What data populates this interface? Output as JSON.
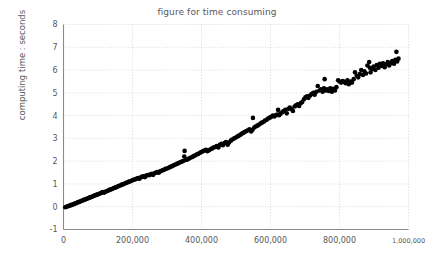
{
  "chart_data": {
    "type": "scatter",
    "title": "figure for time consuming",
    "xlabel": "",
    "ylabel": "computing time : seconds",
    "xlim": [
      0,
      1000000
    ],
    "ylim": [
      -1,
      8
    ],
    "grid": true,
    "legend": null,
    "marker": {
      "shape": "circle",
      "color": "#000000",
      "size": 4.6
    },
    "xticks": [
      0,
      200000,
      400000,
      600000,
      800000,
      1000000
    ],
    "xtick_labels": [
      "0",
      "200,000",
      "400,000",
      "600,000",
      "800,000",
      "1,000,000"
    ],
    "yticks": [
      -1,
      0,
      1,
      2,
      3,
      4,
      5,
      6,
      7,
      8
    ],
    "ytick_labels": [
      "-1",
      "0",
      "1",
      "2",
      "3",
      "4",
      "5",
      "6",
      "7",
      "8"
    ],
    "series": [
      {
        "name": "computing time",
        "x": [
          5000,
          9000,
          12000,
          15000,
          18000,
          21000,
          24000,
          27000,
          30000,
          33000,
          36000,
          39000,
          42000,
          45000,
          48000,
          51000,
          55000,
          58000,
          61000,
          64000,
          67000,
          70000,
          74000,
          77000,
          80000,
          84000,
          87000,
          90000,
          94000,
          97000,
          100000,
          104000,
          107000,
          111000,
          114000,
          118000,
          121000,
          125000,
          128000,
          132000,
          135000,
          139000,
          142000,
          146000,
          150000,
          153000,
          157000,
          160000,
          164000,
          168000,
          171000,
          175000,
          179000,
          182000,
          186000,
          190000,
          194000,
          197000,
          201000,
          205000,
          209000,
          213000,
          216000,
          220000,
          224000,
          228000,
          232000,
          236000,
          240000,
          244000,
          248000,
          252000,
          256000,
          260000,
          264000,
          268000,
          272000,
          276000,
          280000,
          284000,
          288000,
          292000,
          296000,
          300000,
          305000,
          309000,
          313000,
          317000,
          321000,
          326000,
          330000,
          334000,
          338000,
          343000,
          347000,
          350000,
          351000,
          355000,
          360000,
          364000,
          368000,
          373000,
          377000,
          381000,
          386000,
          390000,
          395000,
          399000,
          404000,
          408000,
          413000,
          417000,
          422000,
          426000,
          431000,
          435000,
          440000,
          444000,
          449000,
          453000,
          458000,
          462000,
          467000,
          471000,
          476000,
          480000,
          485000,
          489000,
          494000,
          498000,
          503000,
          507000,
          512000,
          516000,
          521000,
          525000,
          530000,
          535000,
          539000,
          544000,
          548000,
          549000,
          553000,
          557000,
          562000,
          566000,
          571000,
          575000,
          580000,
          584000,
          589000,
          593000,
          598000,
          602000,
          607000,
          611000,
          616000,
          620000,
          622000,
          625000,
          629000,
          634000,
          638000,
          643000,
          647000,
          652000,
          656000,
          661000,
          665000,
          670000,
          674000,
          679000,
          683000,
          688000,
          692000,
          697000,
          701000,
          706000,
          710000,
          715000,
          719000,
          724000,
          728000,
          733000,
          737000,
          742000,
          746000,
          751000,
          755000,
          757000,
          760000,
          764000,
          769000,
          773000,
          778000,
          782000,
          787000,
          791000,
          796000,
          800000,
          805000,
          809000,
          814000,
          818000,
          823000,
          827000,
          832000,
          836000,
          841000,
          845000,
          850000,
          854000,
          859000,
          863000,
          868000,
          872000,
          877000,
          881000,
          886000,
          888000,
          890000,
          895000,
          899000,
          904000,
          908000,
          913000,
          917000,
          922000,
          926000,
          931000,
          935000,
          940000,
          944000,
          949000,
          953000,
          958000,
          962000,
          965000,
          967000,
          971000
        ],
        "y": [
          -0.02,
          0.0,
          0.02,
          0.03,
          0.05,
          0.07,
          0.08,
          0.1,
          0.12,
          0.14,
          0.15,
          0.17,
          0.2,
          0.21,
          0.23,
          0.25,
          0.27,
          0.29,
          0.31,
          0.33,
          0.35,
          0.36,
          0.39,
          0.41,
          0.43,
          0.45,
          0.47,
          0.49,
          0.51,
          0.53,
          0.55,
          0.57,
          0.59,
          0.62,
          0.64,
          0.62,
          0.66,
          0.68,
          0.7,
          0.73,
          0.75,
          0.77,
          0.79,
          0.82,
          0.84,
          0.86,
          0.89,
          0.91,
          0.93,
          0.96,
          0.98,
          1.0,
          1.03,
          1.05,
          1.07,
          1.1,
          1.12,
          1.14,
          1.17,
          1.19,
          1.21,
          1.24,
          1.26,
          1.23,
          1.29,
          1.32,
          1.34,
          1.3,
          1.37,
          1.39,
          1.38,
          1.42,
          1.44,
          1.4,
          1.47,
          1.5,
          1.52,
          1.49,
          1.55,
          1.58,
          1.6,
          1.63,
          1.66,
          1.68,
          1.71,
          1.74,
          1.77,
          1.8,
          1.83,
          1.86,
          1.89,
          1.92,
          1.95,
          1.98,
          2.01,
          2.2,
          2.45,
          2.05,
          2.08,
          2.12,
          2.15,
          2.18,
          2.22,
          2.25,
          2.29,
          2.32,
          2.36,
          2.4,
          2.43,
          2.47,
          2.5,
          2.44,
          2.48,
          2.52,
          2.56,
          2.6,
          2.62,
          2.66,
          2.6,
          2.72,
          2.76,
          2.7,
          2.8,
          2.84,
          2.72,
          2.82,
          2.9,
          2.95,
          2.99,
          3.03,
          3.07,
          3.11,
          3.15,
          3.2,
          3.24,
          3.28,
          3.32,
          3.36,
          3.4,
          3.3,
          3.38,
          3.9,
          3.48,
          3.52,
          3.56,
          3.6,
          3.65,
          3.69,
          3.73,
          3.78,
          3.82,
          3.87,
          3.91,
          3.95,
          4.0,
          3.96,
          4.02,
          4.05,
          4.25,
          4.02,
          4.08,
          4.15,
          4.2,
          4.25,
          4.1,
          4.3,
          4.35,
          4.28,
          4.2,
          4.4,
          4.45,
          4.5,
          4.42,
          4.55,
          4.6,
          4.72,
          4.8,
          4.85,
          4.78,
          4.88,
          4.95,
          5.0,
          4.92,
          5.05,
          5.3,
          5.1,
          5.15,
          5.05,
          5.2,
          5.6,
          5.1,
          5.15,
          5.08,
          5.2,
          5.05,
          5.18,
          5.1,
          5.25,
          5.55,
          5.5,
          5.45,
          5.52,
          5.48,
          5.42,
          5.55,
          5.38,
          5.5,
          5.45,
          5.6,
          5.9,
          5.75,
          5.68,
          5.82,
          6.0,
          5.78,
          5.95,
          5.85,
          6.2,
          6.35,
          6.1,
          5.9,
          6.05,
          6.15,
          6.0,
          6.22,
          6.1,
          6.28,
          6.18,
          6.3,
          6.12,
          6.25,
          6.35,
          6.2,
          6.3,
          6.4,
          6.28,
          6.45,
          6.8,
          6.38,
          6.5
        ]
      }
    ]
  }
}
